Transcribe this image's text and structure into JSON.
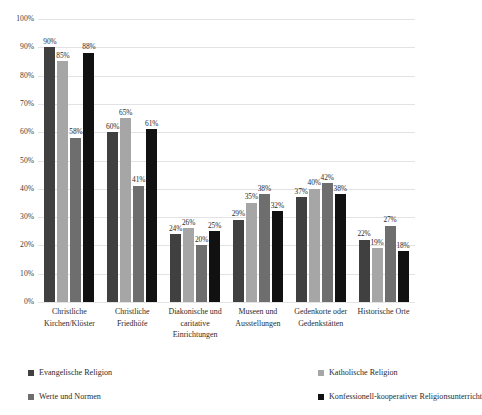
{
  "chart_data": {
    "type": "bar",
    "title": "",
    "xlabel": "",
    "ylabel": "",
    "ylim": [
      0,
      100
    ],
    "grid": true,
    "legend_position": "bottom",
    "value_suffix": "%",
    "yticks": [
      "100%",
      "90%",
      "80%",
      "70%",
      "60%",
      "50%",
      "40%",
      "30%",
      "20%",
      "10%",
      "0%"
    ],
    "ytick_values": [
      100,
      90,
      80,
      70,
      60,
      50,
      40,
      30,
      20,
      10,
      0
    ],
    "categories": [
      "Christliche Kirchen/Klöster",
      "Christliche Friedhöfe",
      "Diakonische und caritative Einrichtungen",
      "Museen und Ausstellungen",
      "Gedenkorte oder Gedenkstätten",
      "Historische Orte"
    ],
    "series": [
      {
        "name": "Evangelische Religion",
        "color": "#404040",
        "values": [
          90,
          60,
          24,
          29,
          37,
          22
        ]
      },
      {
        "name": "Katholische Religion",
        "color": "#a6a6a6",
        "values": [
          85,
          65,
          26,
          35,
          40,
          19
        ]
      },
      {
        "name": "Werte und Normen",
        "color": "#6e6e6e",
        "values": [
          58,
          41,
          20,
          38,
          42,
          27
        ]
      },
      {
        "name": "Konfessionell-kooperativer Religionsunterricht",
        "color": "#111111",
        "values": [
          88,
          61,
          25,
          32,
          38,
          18
        ]
      }
    ],
    "data_labels": [
      [
        "90%",
        "85%",
        "58%",
        "88%"
      ],
      [
        "60%",
        "65%",
        "41%",
        "61%"
      ],
      [
        "24%",
        "26%",
        "20%",
        "25%"
      ],
      [
        "29%",
        "35%",
        "38%",
        "32%"
      ],
      [
        "37%",
        "40%",
        "42%",
        "38%"
      ],
      [
        "22%",
        "19%",
        "27%",
        "18%"
      ]
    ]
  }
}
